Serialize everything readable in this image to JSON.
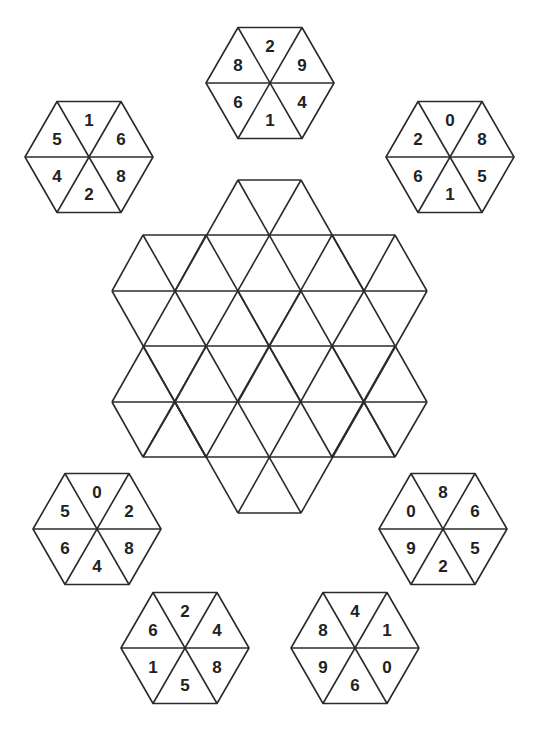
{
  "puzzle": {
    "type": "hexagon-tile-placement",
    "sector_order": [
      "top",
      "upper-right",
      "lower-right",
      "bottom",
      "lower-left",
      "upper-left"
    ],
    "tiles": [
      {
        "id": "tile-top",
        "position": "top",
        "values": [
          "2",
          "9",
          "4",
          "1",
          "6",
          "8"
        ]
      },
      {
        "id": "tile-top-left",
        "position": "top-left",
        "values": [
          "1",
          "6",
          "8",
          "2",
          "4",
          "5"
        ]
      },
      {
        "id": "tile-top-right",
        "position": "top-right",
        "values": [
          "0",
          "8",
          "5",
          "1",
          "6",
          "2"
        ]
      },
      {
        "id": "tile-middle-left",
        "position": "middle-left",
        "values": [
          "0",
          "2",
          "8",
          "4",
          "6",
          "5"
        ]
      },
      {
        "id": "tile-middle-right",
        "position": "middle-right",
        "values": [
          "8",
          "6",
          "5",
          "2",
          "9",
          "0"
        ]
      },
      {
        "id": "tile-bottom-left",
        "position": "bottom-left",
        "values": [
          "2",
          "4",
          "8",
          "5",
          "1",
          "6"
        ]
      },
      {
        "id": "tile-bottom-right",
        "position": "bottom-right",
        "values": [
          "4",
          "1",
          "0",
          "6",
          "9",
          "8"
        ]
      }
    ],
    "central_grid": {
      "shape": "hexagram",
      "description": "Empty six-pointed star made of equilateral triangles"
    }
  },
  "colors": {
    "line": "#2b2b2b",
    "text": "#222222",
    "background": "#ffffff"
  }
}
